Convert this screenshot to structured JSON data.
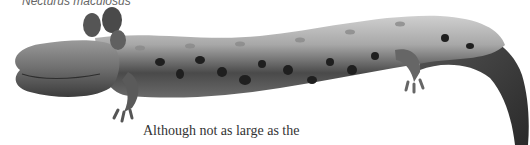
{
  "figure": {
    "species_caption": "Necturus maculosus",
    "illustration": "mudpuppy-salamander-illustration",
    "colors": {
      "body_light": "#b8b8b8",
      "body_mid": "#7a7a7a",
      "body_dark": "#3a3a3a",
      "spots": "#1e1e1e"
    }
  },
  "body_text": {
    "line": "Although not as large as the"
  }
}
